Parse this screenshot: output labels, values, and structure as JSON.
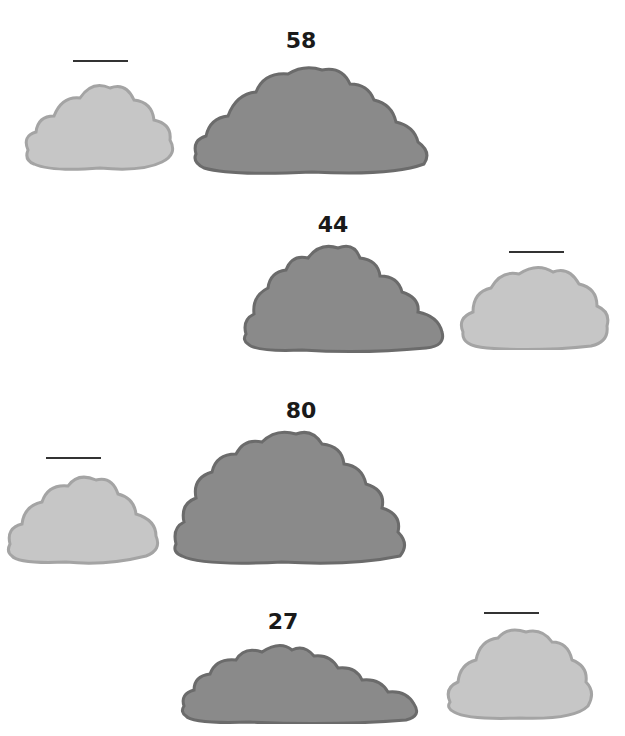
{
  "colors": {
    "dark_fill": "#8a8a8a",
    "dark_stroke": "#6b6b6b",
    "light_fill": "#c6c6c6",
    "light_stroke": "#a4a4a4",
    "line": "#333333"
  },
  "rows": [
    {
      "number": "58",
      "light_position": "left",
      "blank_answer": ""
    },
    {
      "number": "44",
      "light_position": "right",
      "blank_answer": ""
    },
    {
      "number": "80",
      "light_position": "left",
      "blank_answer": ""
    },
    {
      "number": "27",
      "light_position": "right",
      "blank_answer": ""
    }
  ]
}
